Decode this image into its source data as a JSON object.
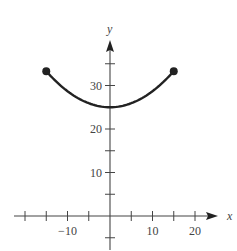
{
  "chart_data": {
    "type": "line",
    "title": "",
    "xlabel": "x",
    "ylabel": "y",
    "xlim": [
      -22,
      25
    ],
    "ylim": [
      -4,
      40
    ],
    "grid": false,
    "x_ticks": [
      -20,
      -15,
      -10,
      -5,
      5,
      10,
      15,
      20
    ],
    "x_tick_labels": [
      {
        "value": -10,
        "label": "−10"
      },
      {
        "value": 10,
        "label": "10"
      },
      {
        "value": 20,
        "label": "20"
      }
    ],
    "y_ticks": [
      -5,
      5,
      10,
      15,
      20,
      25,
      30,
      35
    ],
    "y_tick_labels": [
      {
        "value": 10,
        "label": "10"
      },
      {
        "value": 20,
        "label": "20"
      },
      {
        "value": 30,
        "label": "30"
      }
    ],
    "series": [
      {
        "name": "curve",
        "x": [
          -15,
          -12,
          -9,
          -6,
          -3,
          0,
          3,
          6,
          9,
          12,
          15
        ],
        "y": [
          33.3,
          30.4,
          28.0,
          26.3,
          25.3,
          25.0,
          25.3,
          26.3,
          28.0,
          30.4,
          33.3
        ],
        "endpoints": [
          {
            "x": -15,
            "y": 33.3,
            "marker": "filled-circle"
          },
          {
            "x": 15,
            "y": 33.3,
            "marker": "filled-circle"
          }
        ]
      }
    ],
    "color": "#222222"
  },
  "labels": {
    "x_axis": "x",
    "y_axis": "y"
  }
}
